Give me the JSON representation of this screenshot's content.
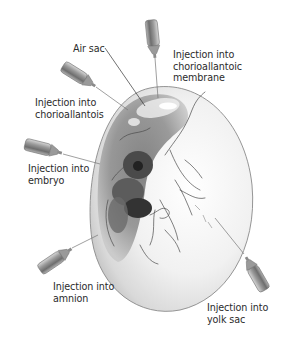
{
  "diagram": {
    "labels": {
      "air_sac": "Air sac",
      "chorioallantoic_membrane": {
        "line1": "Injection into",
        "line2": "chorioallantoic",
        "line3": "membrane"
      },
      "chorioallantois": {
        "line1": "Injection into",
        "line2": "chorioallantois"
      },
      "embryo": {
        "line1": "Injection into",
        "line2": "embryo"
      },
      "amnion": {
        "line1": "Injection into",
        "line2": "amnion"
      },
      "yolk_sac": {
        "line1": "Injection into",
        "line2": "yolk sac"
      }
    },
    "colors": {
      "background": "#ffffff",
      "egg_shell": "#f2f2f2",
      "egg_outline": "#8a8a8a",
      "embryo_dark": "#3a3a3a",
      "vessels": "#4a4a4a",
      "syringe_body": "#8c8c8c",
      "label_text": "#2b2b2b"
    }
  }
}
